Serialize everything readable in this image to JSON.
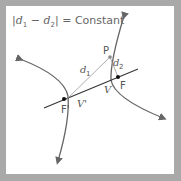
{
  "diagram": {
    "title": {
      "abs_open": "|",
      "d1": "d",
      "d1_sub": "1",
      "minus": " − ",
      "d2": "d",
      "d2_sub": "2",
      "abs_close": "|",
      "equals": " = ",
      "constant": "Constant"
    },
    "labels": {
      "P": "P",
      "d1": "d",
      "d1_sub": "1",
      "d2": "d",
      "d2_sub": "2",
      "F": "F",
      "F_prime": "F'",
      "V": "V",
      "V_prime": "V'"
    },
    "colors": {
      "curve": "#666666",
      "axis": "#333333",
      "distance_line": "#999999",
      "point": "#111111",
      "border": "#a9a9a9"
    }
  }
}
